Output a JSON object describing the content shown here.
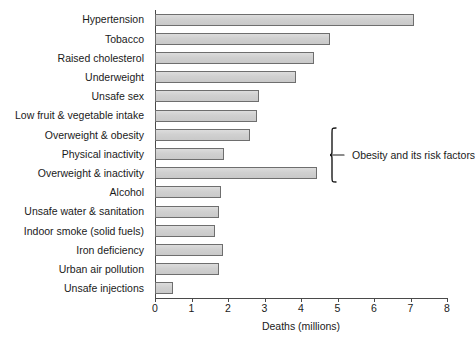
{
  "chart_data": {
    "type": "bar",
    "orientation": "horizontal",
    "title": "",
    "xlabel": "Deaths (millions)",
    "ylabel": "",
    "xlim": [
      0,
      8
    ],
    "xticks": [
      0,
      1,
      2,
      3,
      4,
      5,
      6,
      7,
      8
    ],
    "grid": false,
    "legend": null,
    "categories": [
      "Hypertension",
      "Tobacco",
      "Raised cholesterol",
      "Underweight",
      "Unsafe sex",
      "Low fruit & vegetable intake",
      "Overweight & obesity",
      "Physical inactivity",
      "Overweight & inactivity",
      "Alcohol",
      "Unsafe water & sanitation",
      "Indoor smoke (solid fuels)",
      "Iron deficiency",
      "Urban air pollution",
      "Unsafe injections"
    ],
    "values": [
      7.1,
      4.8,
      4.35,
      3.85,
      2.85,
      2.8,
      2.6,
      1.9,
      4.45,
      1.8,
      1.75,
      1.65,
      1.85,
      1.75,
      0.5
    ],
    "annotations": [
      {
        "text": "Obesity and its risk factors",
        "bracket_categories": [
          "Overweight & obesity",
          "Physical inactivity",
          "Overweight & inactivity"
        ]
      }
    ],
    "colors": {
      "bar_fill": "#d2d2d2",
      "bar_border": "#6e6e6e",
      "axis": "#4a4a4a",
      "text": "#1a1a1a",
      "background": "#ffffff"
    }
  }
}
